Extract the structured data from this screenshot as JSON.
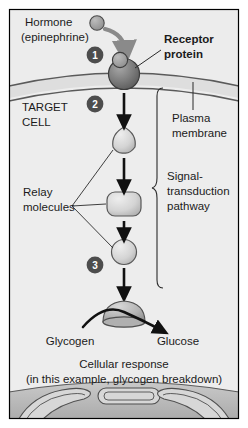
{
  "figure": {
    "title_semantic": "hormone-signal-transduction-pathway",
    "border_color": "#000000",
    "canvas_bg": "#ffffff",
    "extracellular_bg": "#ebebeb",
    "membrane_band_bg": "#dcdcdc",
    "cytoplasm_bg": "#ededed",
    "muscle_band_bg": "#b8b8b8",
    "outline_color": "#3a3a3a",
    "text_color": "#1b1b1b",
    "badge_fill": "#4d4d4d",
    "badge_text_color": "#ffffff",
    "arrow_color": "#111111",
    "hormone_arrow_color": "#8a8a8a",
    "molecule_fill_light": "#d2d2d2",
    "molecule_fill_dark": "#8e8e8e",
    "receptor_fill": "#6e6e6e"
  },
  "labels": {
    "hormone_line1": "Hormone",
    "hormone_line2": "(epinephrine)",
    "receptor_line1": "Receptor",
    "receptor_line2": "protein",
    "target_line1": "TARGET",
    "target_line2": "CELL",
    "plasma_line1": "Plasma",
    "plasma_line2": "membrane",
    "relay_line1": "Relay",
    "relay_line2": "molecules",
    "pathway_line1": "Signal-",
    "pathway_line2": "transduction",
    "pathway_line3": "pathway",
    "glycogen": "Glycogen",
    "glucose": "Glucose",
    "response_line1": "Cellular response",
    "response_line2": "(in this example, glycogen breakdown)"
  },
  "steps": [
    {
      "id": "step-1",
      "number": "1",
      "cx": 95,
      "cy": 55
    },
    {
      "id": "step-2",
      "number": "2",
      "cx": 95,
      "cy": 104
    },
    {
      "id": "step-3",
      "number": "3",
      "cx": 95,
      "cy": 265
    }
  ],
  "molecules": [
    {
      "id": "hormone-molecule",
      "shape": "small-circle",
      "cx": 97,
      "cy": 23,
      "r": 7
    },
    {
      "id": "receptor-protein",
      "shape": "sphere-with-bound-ligand",
      "cx": 124,
      "cy": 72
    },
    {
      "id": "relay-molecule-1",
      "shape": "rounded-triangle",
      "cx": 124,
      "cy": 140
    },
    {
      "id": "relay-molecule-2",
      "shape": "rounded-rect",
      "cx": 124,
      "cy": 203
    },
    {
      "id": "relay-molecule-3",
      "shape": "circle",
      "cx": 124,
      "cy": 252
    },
    {
      "id": "enzyme-molecule",
      "shape": "dome",
      "cx": 124,
      "cy": 313
    }
  ],
  "arrows": [
    {
      "id": "hormone-binding-arrow",
      "type": "curved-thick-gray"
    },
    {
      "id": "transduction-arrow-1",
      "type": "straight-down"
    },
    {
      "id": "transduction-arrow-2",
      "type": "straight-down"
    },
    {
      "id": "transduction-arrow-3",
      "type": "straight-down"
    },
    {
      "id": "response-arrow",
      "type": "straight-down"
    },
    {
      "id": "glycogen-to-glucose-arrow",
      "type": "curved-over-enzyme"
    }
  ],
  "annotations": {
    "receptor_leader": "line from receptor to Receptor protein label",
    "plasma_leader": "vertical line from Plasma membrane label to membrane",
    "relay_leaders": "three fanned lines from Relay molecules to the three relay shapes",
    "pathway_brace": "curly brace spanning the signal-transduction pathway"
  },
  "muscle_fibers": [
    {
      "id": "muscle-fiber-left"
    },
    {
      "id": "muscle-fiber-center"
    },
    {
      "id": "muscle-fiber-right"
    }
  ]
}
